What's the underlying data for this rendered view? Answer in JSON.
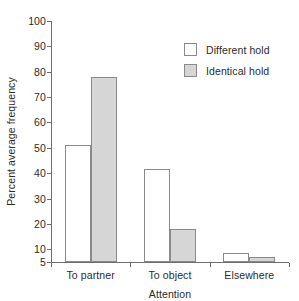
{
  "chart_data": {
    "type": "bar",
    "title": "",
    "xlabel": "Attention",
    "ylabel": "Percent average frequency",
    "categories": [
      "To partner",
      "To object",
      "Elsewhere"
    ],
    "series": [
      {
        "name": "Different hold",
        "values": [
          51,
          41.5,
          8.5
        ],
        "color": "#ffffff"
      },
      {
        "name": "Identical hold",
        "values": [
          78,
          18,
          7
        ],
        "color": "#d6d6d6"
      }
    ],
    "ylim": [
      5,
      100
    ],
    "yticks": [
      5,
      10,
      20,
      30,
      40,
      50,
      60,
      70,
      80,
      90,
      100
    ],
    "ytick_labels": [
      "5",
      "10",
      "20",
      "30",
      "40",
      "50",
      "60",
      "70",
      "80",
      "90",
      "100"
    ],
    "grid": false,
    "legend_position": "upper right",
    "bar_outline_color": "#8a8a8a",
    "axis_color": "#6e6e6e"
  },
  "legend": {
    "entries": [
      {
        "label": "Different hold"
      },
      {
        "label": "Identical hold"
      }
    ]
  }
}
